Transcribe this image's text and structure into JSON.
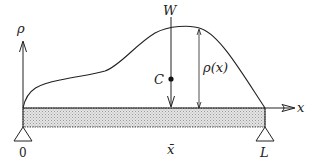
{
  "diagram": {
    "type": "beam-load-distribution",
    "labels": {
      "density_axis": "ρ",
      "x_axis": "x",
      "weight": "W",
      "centroid": "C",
      "density_function": "ρ(x)",
      "origin": "0",
      "centroid_position": "x̄",
      "length": "L"
    },
    "colors": {
      "line": "#222222",
      "beam_fill": "#d8d8d8",
      "background": "#ffffff"
    }
  }
}
